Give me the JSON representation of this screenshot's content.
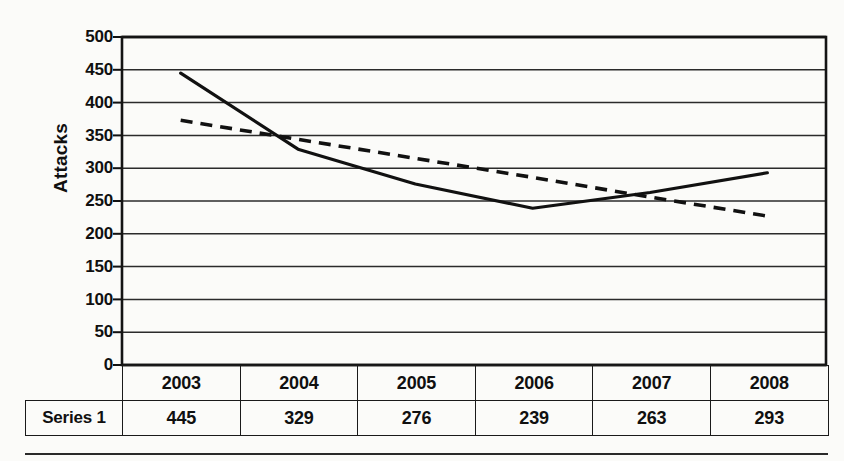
{
  "chart_data": {
    "type": "line",
    "title": "",
    "xlabel": "",
    "ylabel": "Attacks",
    "ylim": [
      0,
      500
    ],
    "ytick_step": 50,
    "yticks": [
      500,
      450,
      400,
      350,
      300,
      250,
      200,
      150,
      100,
      50,
      0
    ],
    "grid": true,
    "legend": "none",
    "categories": [
      "2003",
      "2004",
      "2005",
      "2006",
      "2007",
      "2008"
    ],
    "series": [
      {
        "name": "Series 1",
        "style": "solid",
        "color": "#111111",
        "values": [
          445,
          329,
          276,
          239,
          263,
          293
        ]
      },
      {
        "name": "Linear (Series 1)",
        "style": "dashed",
        "color": "#111111",
        "values": [
          373,
          344,
          315,
          286,
          256,
          227
        ]
      }
    ]
  },
  "table": {
    "row_label_blank": "",
    "header_row": [
      "2003",
      "2004",
      "2005",
      "2006",
      "2007",
      "2008"
    ],
    "data_row_label": "Series 1",
    "data_row": [
      "445",
      "329",
      "276",
      "239",
      "263",
      "293"
    ]
  },
  "axis": {
    "y_title": "Attacks",
    "tick_500": "500",
    "tick_450": "450",
    "tick_400": "400",
    "tick_350": "350",
    "tick_300": "300",
    "tick_250": "250",
    "tick_200": "200",
    "tick_150": "150",
    "tick_100": "100",
    "tick_50": "50",
    "tick_0": "0"
  },
  "colors": {
    "ink": "#111111",
    "page": "#fbfbf9",
    "gridline": "#2b2b2b"
  }
}
